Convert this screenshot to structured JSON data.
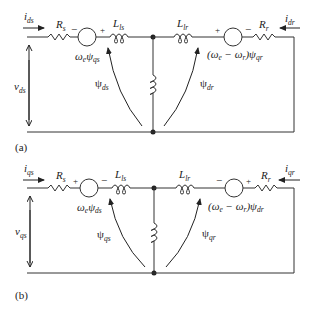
{
  "circuits": [
    {
      "caption": "(a)",
      "current_in": {
        "main": "i",
        "sub": "ds"
      },
      "current_out": {
        "main": "i",
        "sub": "dr"
      },
      "voltage": {
        "main": "v",
        "sub": "ds"
      },
      "stator_resistor": {
        "main": "R",
        "sub": "s"
      },
      "stator_inductor": {
        "main": "L",
        "sub": "ls"
      },
      "rotor_inductor": {
        "main": "L",
        "sub": "lr"
      },
      "rotor_resistor": {
        "main": "R",
        "sub": "r"
      },
      "stator_source": {
        "text": "ω",
        "text_sub": "e",
        "psi": "ψ",
        "psi_sub": "qs",
        "left_sign": "−",
        "right_sign": "+"
      },
      "rotor_source": {
        "text": "(ω",
        "text_sub1": "e",
        "mid": " − ω",
        "text_sub2": "r",
        "end": ")ψ",
        "psi_sub": "qr",
        "left_sign": "+",
        "right_sign": "−"
      },
      "flux_stator": {
        "main": "ψ",
        "sub": "ds"
      },
      "flux_rotor": {
        "main": "ψ",
        "sub": "dr"
      }
    },
    {
      "caption": "(b)",
      "current_in": {
        "main": "i",
        "sub": "qs"
      },
      "current_out": {
        "main": "i",
        "sub": "qr"
      },
      "voltage": {
        "main": "v",
        "sub": "qs"
      },
      "stator_resistor": {
        "main": "R",
        "sub": "s"
      },
      "stator_inductor": {
        "main": "L",
        "sub": "ls"
      },
      "rotor_inductor": {
        "main": "L",
        "sub": "lr"
      },
      "rotor_resistor": {
        "main": "R",
        "sub": "r"
      },
      "stator_source": {
        "text": "ω",
        "text_sub": "e",
        "psi": "ψ",
        "psi_sub": "ds",
        "left_sign": "+",
        "right_sign": "−"
      },
      "rotor_source": {
        "text": "(ω",
        "text_sub1": "e",
        "mid": " − ω",
        "text_sub2": "r",
        "end": ")ψ",
        "psi_sub": "dr",
        "left_sign": "−",
        "right_sign": "+"
      },
      "flux_stator": {
        "main": "ψ",
        "sub": "qs"
      },
      "flux_rotor": {
        "main": "ψ",
        "sub": "qr"
      }
    }
  ]
}
